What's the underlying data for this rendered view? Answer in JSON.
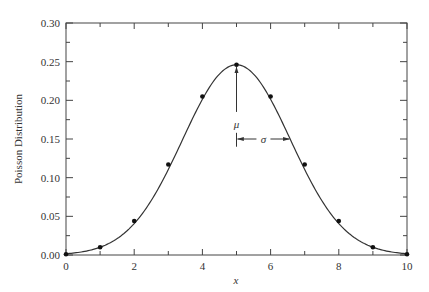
{
  "chart_data": {
    "type": "line",
    "title": "",
    "xlabel": "x",
    "ylabel": "Poisson Distribution",
    "xlim": [
      0,
      10
    ],
    "ylim": [
      0,
      0.3
    ],
    "grid": false,
    "legend": null,
    "x_ticks": [
      0,
      2,
      4,
      6,
      8,
      10
    ],
    "x_tick_labels": [
      "0",
      "2",
      "4",
      "6",
      "8",
      "10"
    ],
    "x_minor_ticks": [
      1,
      3,
      5,
      7,
      9
    ],
    "y_ticks": [
      0,
      0.05,
      0.1,
      0.15,
      0.2,
      0.25,
      0.3
    ],
    "y_tick_labels": [
      "0.00",
      "0.05",
      "0.10",
      "0.15",
      "0.20",
      "0.25",
      "0.30"
    ],
    "series": [
      {
        "name": "data points",
        "style": "markers",
        "x": [
          0,
          1,
          2,
          3,
          4,
          5,
          6,
          7,
          8,
          9,
          10
        ],
        "y": [
          0.001,
          0.01,
          0.044,
          0.117,
          0.205,
          0.246,
          0.205,
          0.117,
          0.044,
          0.01,
          0.001
        ]
      },
      {
        "name": "smooth curve",
        "style": "line",
        "x": [
          0,
          1,
          2,
          3,
          4,
          5,
          6,
          7,
          8,
          9,
          10
        ],
        "y": [
          0.001,
          0.01,
          0.044,
          0.117,
          0.205,
          0.246,
          0.205,
          0.117,
          0.044,
          0.01,
          0.001
        ]
      }
    ],
    "annotations": [
      {
        "label": "μ",
        "type": "vertical-arrow",
        "x": 5,
        "y_from": 0.14,
        "y_to": 0.243,
        "text_y": 0.17
      },
      {
        "label": "σ",
        "type": "horizontal-double-arrow",
        "x_from": 5,
        "x_to": 6.58,
        "y": 0.15
      }
    ]
  }
}
